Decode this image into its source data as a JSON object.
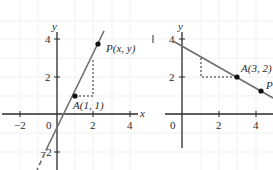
{
  "figure_left": {
    "axis_labels": {
      "x": "x",
      "y": "y"
    },
    "x_ticks": [
      "−2",
      "0",
      "2",
      "4"
    ],
    "y_ticks": [
      "4",
      "2",
      "−2"
    ],
    "points": [
      {
        "label": "A(1, 1)",
        "x": 1,
        "y": 1
      },
      {
        "label": "P(x, y)",
        "x": 2.2,
        "y": 3.7
      }
    ],
    "line": {
      "description": "line through A(1,1) with slope 3",
      "slope": 3,
      "intercept": -2
    }
  },
  "figure_right": {
    "axis_labels": {
      "x": "",
      "y": "y"
    },
    "x_ticks": [
      "0",
      "2",
      "4"
    ],
    "y_ticks": [
      "4",
      "2"
    ],
    "points": [
      {
        "label": "A(3, 2)",
        "x": 3,
        "y": 2
      },
      {
        "label": "P",
        "x": 4.3,
        "y": 1.25
      }
    ],
    "line": {
      "description": "line through A(3,2) with negative slope",
      "slope": -0.5,
      "intercept": 3.5
    }
  }
}
